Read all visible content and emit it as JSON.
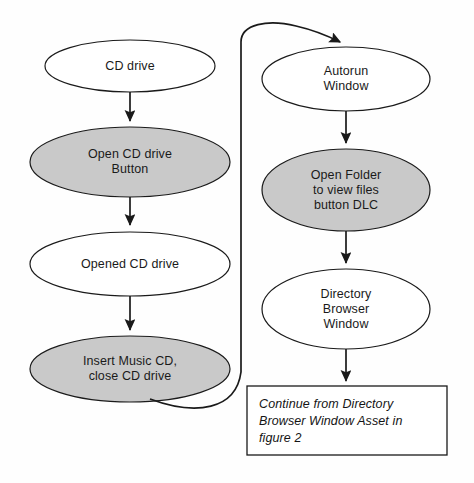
{
  "figure": {
    "type": "flowchart",
    "title": "",
    "background_color": "#fefefe",
    "shaded_fill": "#c9c9c9",
    "plain_fill": "#ffffff",
    "stroke_color": "#1a1a1a"
  },
  "nodes": [
    {
      "id": "cd-drive",
      "label": "CD drive",
      "shape": "ellipse",
      "style": "plain",
      "column": "left",
      "cx": 130,
      "cy": 66,
      "rx": 85,
      "ry": 26
    },
    {
      "id": "open-cd-drive-button",
      "label": "Open CD drive\nButton",
      "shape": "ellipse",
      "style": "shaded",
      "column": "left",
      "cx": 130,
      "cy": 162,
      "rx": 100,
      "ry": 35
    },
    {
      "id": "opened-cd-drive",
      "label": "Opened CD drive",
      "shape": "ellipse",
      "style": "plain",
      "column": "left",
      "cx": 130,
      "cy": 264,
      "rx": 100,
      "ry": 32
    },
    {
      "id": "insert-music-cd",
      "label": "Insert Music CD,\nclose CD drive",
      "shape": "ellipse",
      "style": "shaded",
      "column": "left",
      "cx": 130,
      "cy": 369,
      "rx": 100,
      "ry": 33
    },
    {
      "id": "autorun-window",
      "label": "Autorun\nWindow",
      "shape": "ellipse",
      "style": "plain",
      "column": "right",
      "cx": 346,
      "cy": 79,
      "rx": 84,
      "ry": 32
    },
    {
      "id": "open-folder-button-dlc",
      "label": "Open Folder\nto view files\nbutton DLC",
      "shape": "ellipse",
      "style": "shaded",
      "column": "right",
      "cx": 346,
      "cy": 190,
      "rx": 84,
      "ry": 41
    },
    {
      "id": "directory-browser-window",
      "label": "Directory\nBrowser\nWindow",
      "shape": "ellipse",
      "style": "plain",
      "column": "right",
      "cx": 346,
      "cy": 309,
      "rx": 84,
      "ry": 40
    }
  ],
  "note_box": {
    "id": "continue-note",
    "text": "Continue from Directory\nBrowser Window Asset in\nfigure 2",
    "shape": "rectangle",
    "x": 247,
    "y": 386,
    "width": 200,
    "height": 69
  },
  "edges": [
    {
      "id": "e1",
      "from": "cd-drive",
      "to": "open-cd-drive-button",
      "type": "straight-arrow"
    },
    {
      "id": "e2",
      "from": "open-cd-drive-button",
      "to": "opened-cd-drive",
      "type": "straight-arrow"
    },
    {
      "id": "e3",
      "from": "opened-cd-drive",
      "to": "insert-music-cd",
      "type": "straight-arrow"
    },
    {
      "id": "e4",
      "from": "insert-music-cd",
      "to": "autorun-window",
      "type": "curved-arrow"
    },
    {
      "id": "e5",
      "from": "autorun-window",
      "to": "open-folder-button-dlc",
      "type": "straight-arrow"
    },
    {
      "id": "e6",
      "from": "open-folder-button-dlc",
      "to": "directory-browser-window",
      "type": "straight-arrow"
    },
    {
      "id": "e7",
      "from": "directory-browser-window",
      "to": "continue-note",
      "type": "straight-arrow"
    }
  ]
}
